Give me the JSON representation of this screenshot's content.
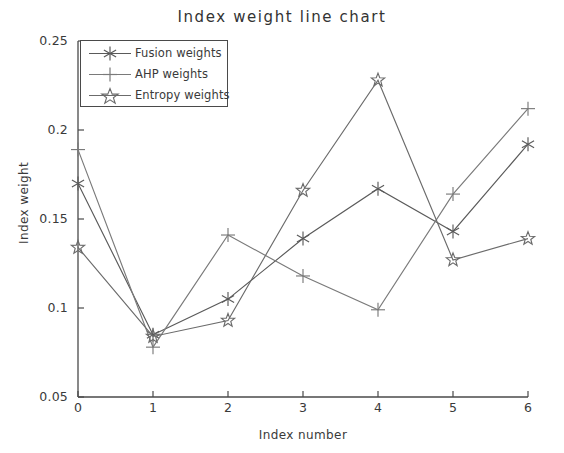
{
  "chart_data": {
    "type": "line",
    "title": "Index weight line chart",
    "xlabel": "Index number",
    "ylabel": "Index weight",
    "x": [
      0,
      1,
      2,
      3,
      4,
      5,
      6
    ],
    "xlim": [
      0,
      6
    ],
    "ylim": [
      0.05,
      0.25
    ],
    "xticks": [
      "0",
      "1",
      "2",
      "3",
      "4",
      "5",
      "6"
    ],
    "yticks": [
      "0.05",
      "0.1",
      "0.15",
      "0.2",
      "0.25"
    ],
    "grid": false,
    "legend_position": "upper-left",
    "series": [
      {
        "name": "Fusion weights",
        "marker": "asterisk",
        "color": "#5a5a5a",
        "values": [
          0.17,
          0.085,
          0.105,
          0.139,
          0.167,
          0.143,
          0.192
        ]
      },
      {
        "name": "AHP weights",
        "marker": "plus",
        "color": "#7a7a7a",
        "values": [
          0.189,
          0.078,
          0.141,
          0.118,
          0.099,
          0.164,
          0.212
        ]
      },
      {
        "name": "Entropy weights",
        "marker": "star",
        "color": "#6b6b6b",
        "values": [
          0.134,
          0.084,
          0.093,
          0.166,
          0.228,
          0.127,
          0.139
        ]
      }
    ]
  },
  "legend": {
    "items": [
      {
        "label": "Fusion weights"
      },
      {
        "label": "AHP weights"
      },
      {
        "label": "Entropy weights"
      }
    ]
  }
}
